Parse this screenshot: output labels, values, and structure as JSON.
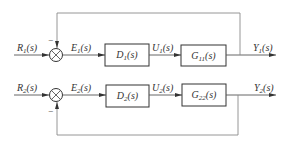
{
  "diagram": {
    "type": "two-loop decoupled feedback control block diagram",
    "loops": [
      {
        "id": "loop1",
        "input": {
          "sym": "R",
          "sub": "1",
          "arg": "(s)"
        },
        "error": {
          "sym": "E",
          "sub": "1",
          "arg": "(s)"
        },
        "controller": {
          "sym": "D",
          "sub": "1",
          "arg": "(s)"
        },
        "control": {
          "sym": "U",
          "sub": "1",
          "arg": "(s)"
        },
        "plant": {
          "sym": "G",
          "sub": "11",
          "arg": "(s)"
        },
        "output": {
          "sym": "Y",
          "sub": "1",
          "arg": "(s)"
        },
        "feedback_sign": "−"
      },
      {
        "id": "loop2",
        "input": {
          "sym": "R",
          "sub": "2",
          "arg": "(s)"
        },
        "error": {
          "sym": "E",
          "sub": "2",
          "arg": "(s)"
        },
        "controller": {
          "sym": "D",
          "sub": "2",
          "arg": "(s)"
        },
        "control": {
          "sym": "U",
          "sub": "2",
          "arg": "(s)"
        },
        "plant": {
          "sym": "G",
          "sub": "22",
          "arg": "(s)"
        },
        "output": {
          "sym": "Y",
          "sub": "2",
          "arg": "(s)"
        },
        "feedback_sign": "−"
      }
    ]
  }
}
